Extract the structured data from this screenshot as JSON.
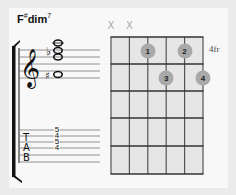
{
  "chord": {
    "root": "F",
    "accidental": "#",
    "quality": "dim",
    "superscript": "7"
  },
  "diagram": {
    "position_label": "4fr",
    "strings": 6,
    "frets": 5,
    "muted_strings": [
      1,
      2
    ],
    "mute_symbol": "X",
    "fingers": [
      {
        "string": 3,
        "fret": 1,
        "finger": "1"
      },
      {
        "string": 5,
        "fret": 1,
        "finger": "2"
      },
      {
        "string": 4,
        "fret": 2,
        "finger": "3"
      },
      {
        "string": 6,
        "fret": 2,
        "finger": "4"
      }
    ]
  },
  "notation": {
    "notes": [
      {
        "name": "F#",
        "accidental": "♯"
      },
      {
        "name": "C"
      },
      {
        "name": "Eb",
        "accidental": "♭"
      },
      {
        "name": "A"
      }
    ]
  },
  "tab": {
    "label": [
      "T",
      "A",
      "B"
    ],
    "frets": [
      "5",
      "4",
      "5",
      "4"
    ]
  },
  "colors": {
    "background": "#ebebeb",
    "panel": "#f8f8f8",
    "grid_cell": "#e6e6e6",
    "grid_line": "#555555",
    "dot": "#a9a9a9",
    "mute": "#aaaaaa"
  }
}
